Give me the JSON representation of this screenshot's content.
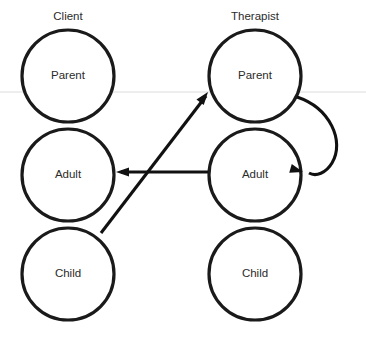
{
  "diagram": {
    "type": "transactional-analysis-ego-state-diagram",
    "background_color": "#ffffff",
    "stroke_color": "#1a1a1a",
    "text_color": "#2b2b2b",
    "scan_line_color": "#dcdcdc",
    "columns": [
      {
        "id": "client",
        "label": "Client",
        "label_x": 68,
        "label_y": 17,
        "center_x": 68,
        "ego_states": [
          {
            "id": "client-parent",
            "label": "Parent",
            "cx": 68,
            "cy": 76,
            "r": 46
          },
          {
            "id": "client-adult",
            "label": "Adult",
            "cx": 68,
            "cy": 175,
            "r": 46
          },
          {
            "id": "client-child",
            "label": "Child",
            "cx": 68,
            "cy": 274,
            "r": 46
          }
        ]
      },
      {
        "id": "therapist",
        "label": "Therapist",
        "label_x": 255,
        "label_y": 17,
        "center_x": 255,
        "ego_states": [
          {
            "id": "therapist-parent",
            "label": "Parent",
            "cx": 255,
            "cy": 76,
            "r": 46
          },
          {
            "id": "therapist-adult",
            "label": "Adult",
            "cx": 255,
            "cy": 175,
            "r": 46
          },
          {
            "id": "therapist-child",
            "label": "Child",
            "cx": 255,
            "cy": 274,
            "r": 46
          }
        ]
      }
    ],
    "transactions": [
      {
        "id": "client-child-to-therapist-parent",
        "kind": "diagonal-arrow",
        "from": "client-child",
        "to": "therapist-parent",
        "path": "M 101 233 L 208 93",
        "head_x": 208,
        "head_y": 93,
        "head_angle": -52.6
      },
      {
        "id": "therapist-adult-to-client-adult",
        "kind": "horizontal-arrow",
        "from": "therapist-adult",
        "to": "client-adult",
        "path": "M 207 172 L 120 172",
        "head_x": 116,
        "head_y": 172,
        "head_angle": 180
      },
      {
        "id": "therapist-parent-to-therapist-adult",
        "kind": "curved-self-loop-arrow",
        "from": "therapist-parent",
        "to": "therapist-adult",
        "path": "M 297 97 C 330 108, 344 140, 332 163 C 326 173, 316 176, 308 173",
        "head_x": 303,
        "head_y": 172,
        "head_angle": 198
      }
    ],
    "scan_artifact": {
      "id": "horizontal-scan-line",
      "y": 92,
      "x1": 0,
      "x2": 366
    }
  }
}
